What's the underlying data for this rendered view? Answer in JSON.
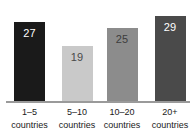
{
  "chart_data": {
    "type": "bar",
    "title": "",
    "subtitle": "",
    "xlabel": "",
    "ylabel": "",
    "categories": [
      "1–5 countries",
      "5–10 countries",
      "10–20 countries",
      "20+ countries"
    ],
    "category_lines": [
      {
        "line1": "1–5",
        "line2": "countries"
      },
      {
        "line1": "5–10",
        "line2": "countries"
      },
      {
        "line1": "10–20",
        "line2": "countries"
      },
      {
        "line1": "20+",
        "line2": "countries"
      }
    ],
    "values": [
      27,
      19,
      25,
      29
    ],
    "value_labels": [
      "27",
      "19",
      "25",
      "29"
    ],
    "bar_colors": [
      "#1a1a1a",
      "#c9c9c9",
      "#8c8c8c",
      "#4a4a4a"
    ],
    "value_label_colors": [
      "#ffffff",
      "#4a4a4a",
      "#3c3c3c",
      "#ffffff"
    ],
    "ylim": [
      0,
      35
    ],
    "grid": false,
    "legend": "none",
    "axis_color": "#9a9a9a",
    "background": "#ffffff"
  }
}
